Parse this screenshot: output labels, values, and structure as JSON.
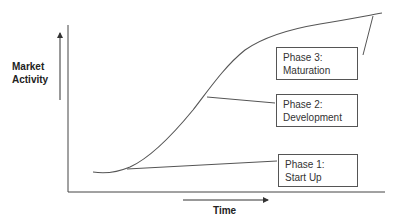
{
  "diagram": {
    "type": "s-curve lifecycle diagram",
    "y_axis_label": "Market Activity",
    "y_axis_label_lines": [
      "Market",
      "Activity"
    ],
    "x_axis_label": "Time",
    "phases": [
      {
        "title": "Phase 1:",
        "name": "Start Up"
      },
      {
        "title": "Phase 2:",
        "name": "Development"
      },
      {
        "title": "Phase 3:",
        "name": "Maturation"
      }
    ],
    "colors": {
      "line": "#444444",
      "box_border": "#555555",
      "text": "#222222",
      "background": "#ffffff"
    }
  }
}
